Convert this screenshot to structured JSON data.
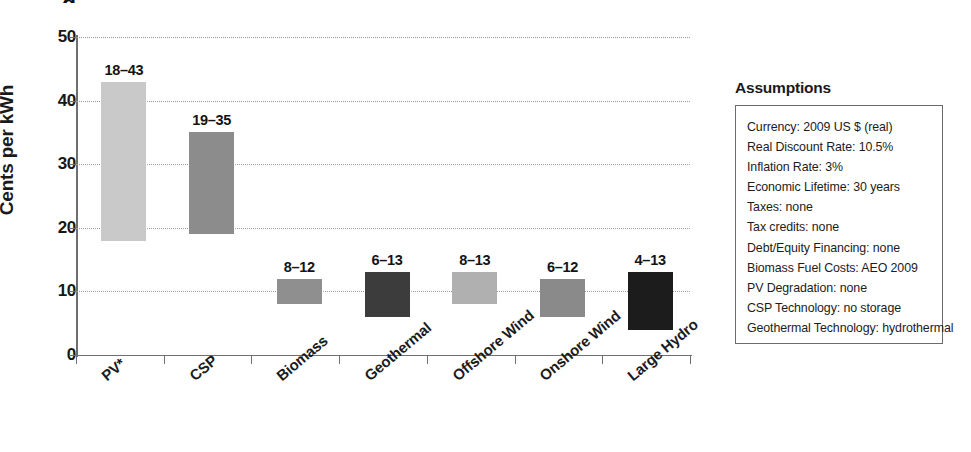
{
  "chart_data": {
    "type": "bar",
    "title": "",
    "xlabel": "",
    "ylabel": "Cents per kWh",
    "ylim": [
      0,
      50
    ],
    "yticks": [
      0,
      10,
      20,
      30,
      40,
      50
    ],
    "grid": true,
    "legend": "none",
    "note": "Floating range bars: each bar spans its low-to-high levelized cost estimate",
    "categories": [
      "PV*",
      "CSP",
      "Biomass",
      "Geothermal",
      "Offshore Wind",
      "Onshore Wind",
      "Large Hydro"
    ],
    "value_labels": [
      "18–43",
      "19–35",
      "8–12",
      "6–13",
      "8–13",
      "6–12",
      "4–13"
    ],
    "low": [
      18,
      19,
      8,
      6,
      8,
      6,
      4
    ],
    "high": [
      43,
      35,
      12,
      13,
      13,
      12,
      13
    ],
    "bar_colors": [
      "#c9c9c9",
      "#8c8c8c",
      "#8f8f8f",
      "#3c3c3c",
      "#b0b0b0",
      "#8a8a8a",
      "#1c1c1c"
    ]
  },
  "assumptions": {
    "title": "Assumptions",
    "lines": [
      "Currency: 2009 US $ (real)",
      "Real Discount Rate: 10.5%",
      "Inflation Rate: 3%",
      "Economic Lifetime: 30 years",
      "Taxes: none",
      "Tax credits: none",
      "Debt/Equity Financing: none",
      "Biomass Fuel Costs: AEO 2009",
      "PV Degradation: none",
      "CSP Technology: no storage",
      "Geothermal Technology: hydrothermal"
    ]
  }
}
